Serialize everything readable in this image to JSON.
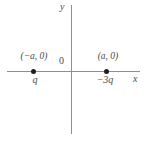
{
  "figure": {
    "background_color": "#ffffff",
    "axis_color": "#8f8f8f",
    "dot_color": "#1e1e1e",
    "text_color": "#4a4a4a",
    "axes": {
      "x_label": "x",
      "y_label": "y",
      "origin_label": "0"
    },
    "points": [
      {
        "coordinate_label": "(−a, 0)",
        "charge_label": "q",
        "side": "left"
      },
      {
        "coordinate_label": "(a, 0)",
        "charge_label": "−3q",
        "side": "right"
      }
    ]
  }
}
